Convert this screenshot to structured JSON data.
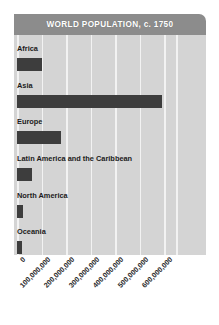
{
  "chart": {
    "title": "WORLD POPULATION, c. 1750",
    "title_bar_color": "#8c8c8c",
    "panel_color": "#d4d4d4",
    "bar_color": "#3d3d3d",
    "gridline_color": "#f2f2f2"
  },
  "chart_data": {
    "type": "bar",
    "orientation": "horizontal",
    "title": "WORLD POPULATION, c. 1750",
    "xlabel": "",
    "ylabel": "",
    "grid": true,
    "legend": "none",
    "xlim": [
      0,
      650000000
    ],
    "categories": [
      "Africa",
      "Asia",
      "Europe",
      "Latin America and the Caribbean",
      "North America",
      "Oceania"
    ],
    "values": [
      100000000,
      590000000,
      180000000,
      60000000,
      25000000,
      20000000
    ],
    "xticks": [
      0,
      100000000,
      200000000,
      300000000,
      400000000,
      500000000,
      600000000
    ],
    "xtick_labels": [
      "0",
      "100,000,000",
      "200,000,000",
      "300,000,000",
      "400,000,000",
      "500,000,000",
      "600,000,000"
    ]
  }
}
